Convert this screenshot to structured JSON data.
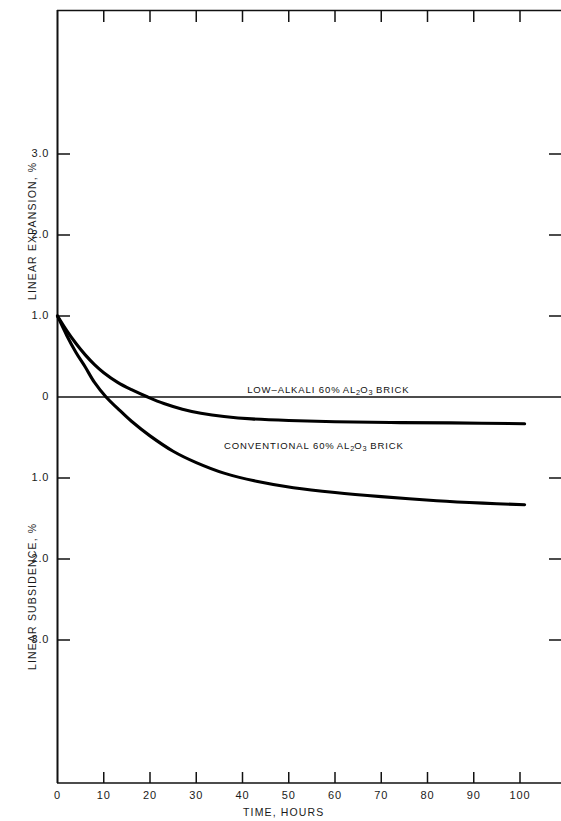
{
  "chart_data": {
    "type": "line",
    "title": "",
    "xlabel": "TIME, HOURS",
    "ylabel_top": "LINEAR EXPANSION, %",
    "ylabel_bottom": "LINEAR SUBSIDENCE, %",
    "xlim": [
      0,
      108
    ],
    "ylim": [
      -3.6,
      3.6
    ],
    "xticks": [
      0,
      10,
      20,
      30,
      40,
      50,
      60,
      70,
      80,
      90,
      100
    ],
    "xtick_labels": [
      "0",
      "10",
      "20",
      "30",
      "40",
      "50",
      "60",
      "70",
      "80",
      "90",
      "100"
    ],
    "yticks_top": [
      1.0,
      2.0,
      3.0
    ],
    "ytick_labels_top": [
      "1.0",
      "2.0",
      "3.0"
    ],
    "ytick_zero_label": "0",
    "yticks_bottom": [
      -1.0,
      -2.0,
      -3.0
    ],
    "ytick_labels_bottom": [
      "1.0",
      "2.0",
      "3.0"
    ],
    "grid": false,
    "legend_position": "inline-annotation",
    "zero_line": true,
    "line_color": "#000000",
    "series": [
      {
        "name": "LOW-ALKALI 60% AL2O3 BRICK",
        "label_html": "LOW–ALKALI 60<span class=\"pct\">%</span> AL<sub>2</sub>O<sub>3</sub> BRICK",
        "zero_crossing_hours": 19.5,
        "final_value": -0.33,
        "x": [
          0,
          2,
          4,
          6,
          8,
          10,
          13,
          16,
          19.5,
          23,
          27,
          31,
          36,
          42,
          50,
          60,
          72,
          85,
          101
        ],
        "y": [
          1.0,
          0.82,
          0.66,
          0.52,
          0.4,
          0.3,
          0.18,
          0.09,
          0.0,
          -0.08,
          -0.15,
          -0.2,
          -0.24,
          -0.27,
          -0.29,
          -0.305,
          -0.315,
          -0.32,
          -0.33
        ]
      },
      {
        "name": "CONVENTIONAL 60% AL2O3 BRICK",
        "label_html": "CONVENTIONAL 60<span class=\"pct\">%</span> AL<sub>2</sub>O<sub>3</sub> BRICK",
        "zero_crossing_hours": 10.5,
        "final_value": -1.33,
        "x": [
          0,
          2,
          4,
          6,
          8,
          10.5,
          13,
          16,
          20,
          25,
          30,
          36,
          43,
          51,
          60,
          70,
          82,
          92,
          101
        ],
        "y": [
          1.0,
          0.76,
          0.55,
          0.37,
          0.18,
          0.0,
          -0.14,
          -0.3,
          -0.48,
          -0.67,
          -0.81,
          -0.94,
          -1.04,
          -1.12,
          -1.18,
          -1.23,
          -1.28,
          -1.31,
          -1.33
        ]
      }
    ],
    "annotations": [
      {
        "name": "low-alkali-label",
        "text": "LOW-ALKALI 60% AL2O3 BRICK",
        "x_hours": 41,
        "y_value": 0.07
      },
      {
        "name": "conventional-label",
        "text": "CONVENTIONAL 60% AL2O3 BRICK",
        "x_hours": 36,
        "y_value": -0.62
      }
    ]
  }
}
